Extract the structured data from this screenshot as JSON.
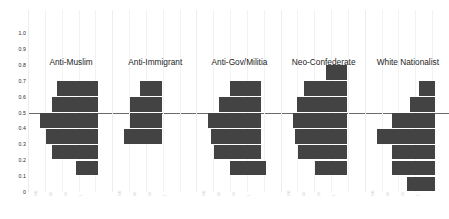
{
  "chart_data": {
    "type": "bar",
    "orientation": "horizontal",
    "title": "",
    "subtitle": "",
    "xlabel": "",
    "ylabel": "",
    "ylim": [
      0,
      1.0
    ],
    "ytick_labels": [
      "1.0",
      "0.9",
      "0.8",
      "0.7",
      "0.6",
      "0.5",
      "0.4",
      "0.3",
      "0.2",
      "0.1",
      "0"
    ],
    "ytick_values": [
      1.0,
      0.9,
      0.8,
      0.7,
      0.6,
      0.5,
      0.4,
      0.3,
      0.2,
      0.1,
      0
    ],
    "grid": "vertical-faint",
    "legend": "none",
    "reference_line": {
      "axis": "y",
      "value": 0.5,
      "color": "#6b6b6b"
    },
    "bar_color": "#434343",
    "bin_width": 0.1,
    "note": "Five grouped horizontal histograms; each bar is a 0.1-wide bin on the vertical axis, bar length = frequency.",
    "groups": [
      {
        "label": "Anti-Muslim",
        "bins": [
          {
            "bin_top": 0.7,
            "bin_bottom": 0.6,
            "start": 0.3,
            "length": 0.7
          },
          {
            "bin_top": 0.6,
            "bin_bottom": 0.5,
            "start": 0.2,
            "length": 0.8
          },
          {
            "bin_top": 0.5,
            "bin_bottom": 0.4,
            "start": 0.0,
            "length": 1.0
          },
          {
            "bin_top": 0.4,
            "bin_bottom": 0.3,
            "start": 0.1,
            "length": 0.9
          },
          {
            "bin_top": 0.3,
            "bin_bottom": 0.2,
            "start": 0.2,
            "length": 0.8
          },
          {
            "bin_top": 0.2,
            "bin_bottom": 0.1,
            "start": 0.62,
            "length": 0.38
          }
        ]
      },
      {
        "label": "Anti-Immigrant",
        "bins": [
          {
            "bin_top": 0.7,
            "bin_bottom": 0.6,
            "start": 0.28,
            "length": 0.38
          },
          {
            "bin_top": 0.6,
            "bin_bottom": 0.5,
            "start": 0.1,
            "length": 0.56
          },
          {
            "bin_top": 0.5,
            "bin_bottom": 0.4,
            "start": 0.1,
            "length": 0.56
          },
          {
            "bin_top": 0.4,
            "bin_bottom": 0.3,
            "start": 0.0,
            "length": 0.66
          }
        ]
      },
      {
        "label": "Anti-Gov/Militia",
        "bins": [
          {
            "bin_top": 0.7,
            "bin_bottom": 0.6,
            "start": 0.38,
            "length": 0.52
          },
          {
            "bin_top": 0.6,
            "bin_bottom": 0.5,
            "start": 0.18,
            "length": 0.72
          },
          {
            "bin_top": 0.5,
            "bin_bottom": 0.4,
            "start": 0.0,
            "length": 0.9
          },
          {
            "bin_top": 0.4,
            "bin_bottom": 0.3,
            "start": 0.05,
            "length": 0.85
          },
          {
            "bin_top": 0.3,
            "bin_bottom": 0.2,
            "start": 0.1,
            "length": 0.8
          },
          {
            "bin_top": 0.2,
            "bin_bottom": 0.1,
            "start": 0.38,
            "length": 0.62
          }
        ]
      },
      {
        "label": "Neo-Confederate",
        "bins": [
          {
            "bin_top": 0.8,
            "bin_bottom": 0.7,
            "start": 0.58,
            "length": 0.36
          },
          {
            "bin_top": 0.7,
            "bin_bottom": 0.6,
            "start": 0.2,
            "length": 0.74
          },
          {
            "bin_top": 0.6,
            "bin_bottom": 0.5,
            "start": 0.08,
            "length": 0.86
          },
          {
            "bin_top": 0.5,
            "bin_bottom": 0.4,
            "start": 0.0,
            "length": 0.94
          },
          {
            "bin_top": 0.4,
            "bin_bottom": 0.3,
            "start": 0.04,
            "length": 0.9
          },
          {
            "bin_top": 0.3,
            "bin_bottom": 0.2,
            "start": 0.1,
            "length": 0.84
          },
          {
            "bin_top": 0.2,
            "bin_bottom": 0.1,
            "start": 0.38,
            "length": 0.56
          }
        ]
      },
      {
        "label": "White Nationalist",
        "bins": [
          {
            "bin_top": 0.7,
            "bin_bottom": 0.6,
            "start": 0.72,
            "length": 0.28
          },
          {
            "bin_top": 0.6,
            "bin_bottom": 0.5,
            "start": 0.58,
            "length": 0.42
          },
          {
            "bin_top": 0.5,
            "bin_bottom": 0.4,
            "start": 0.26,
            "length": 0.74
          },
          {
            "bin_top": 0.4,
            "bin_bottom": 0.3,
            "start": 0.0,
            "length": 1.0
          },
          {
            "bin_top": 0.3,
            "bin_bottom": 0.2,
            "start": 0.26,
            "length": 0.74
          },
          {
            "bin_top": 0.2,
            "bin_bottom": 0.1,
            "start": 0.26,
            "length": 0.74
          },
          {
            "bin_top": 0.1,
            "bin_bottom": 0.0,
            "start": 0.52,
            "length": 0.48
          }
        ]
      }
    ]
  }
}
